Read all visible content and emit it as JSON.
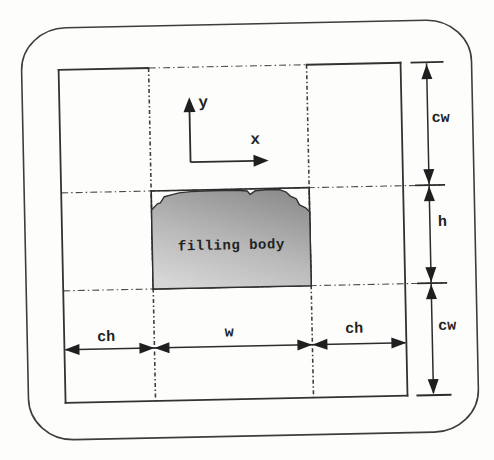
{
  "diagram": {
    "filling_body_label": "filling body",
    "axes": {
      "x_label": "x",
      "y_label": "y"
    },
    "dims": {
      "right_top": "cw",
      "right_middle": "h",
      "right_bottom": "cw",
      "bottom_left": "ch",
      "bottom_middle": "w",
      "bottom_right": "ch"
    },
    "colors": {
      "ink": "#2c2c2c",
      "dash_line": "#4c4c4c",
      "body_fill_dark": "#8e8e8e",
      "body_fill_light": "#dcdcdc",
      "paper": "#fdfdfc"
    }
  }
}
